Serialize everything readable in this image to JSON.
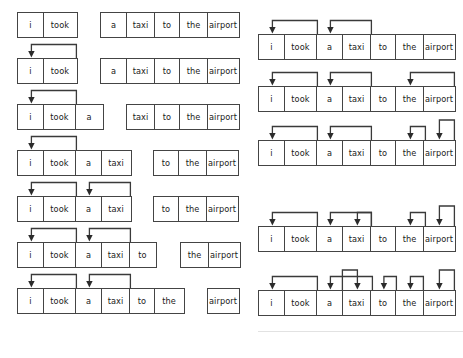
{
  "diagram": {
    "tokens": [
      "i",
      "took",
      "a",
      "taxi",
      "to",
      "the",
      "airport"
    ],
    "canvas": {
      "width": 463,
      "height": 358
    },
    "style": {
      "box_border_color": "#444444",
      "box_fill_color": "#ffffff",
      "arrow_color": "#3a3a3a",
      "text_color": "#1a1a1a"
    },
    "columns": [
      {
        "name": "left-column",
        "label": "progressive-prefix-column",
        "rows": [
          {
            "index": 0,
            "prefix": [
              "i",
              "took"
            ],
            "suffix": [
              "a",
              "taxi",
              "to",
              "the",
              "airport"
            ],
            "arrow_count": 0,
            "arrow_targets": []
          },
          {
            "index": 1,
            "prefix": [
              "i",
              "took"
            ],
            "suffix": [
              "a",
              "taxi",
              "to",
              "the",
              "airport"
            ],
            "arrow_count": 1,
            "arrow_targets": [
              "i"
            ]
          },
          {
            "index": 2,
            "prefix": [
              "i",
              "took",
              "a"
            ],
            "suffix": [
              "taxi",
              "to",
              "the",
              "airport"
            ],
            "arrow_count": 1,
            "arrow_targets": [
              "i"
            ]
          },
          {
            "index": 3,
            "prefix": [
              "i",
              "took",
              "a",
              "taxi"
            ],
            "suffix": [
              "to",
              "the",
              "airport"
            ],
            "arrow_count": 1,
            "arrow_targets": [
              "i"
            ]
          },
          {
            "index": 4,
            "prefix": [
              "i",
              "took",
              "a",
              "taxi"
            ],
            "suffix": [
              "to",
              "the",
              "airport"
            ],
            "arrow_count": 2,
            "arrow_targets": [
              "i",
              "a"
            ]
          },
          {
            "index": 5,
            "prefix": [
              "i",
              "took",
              "a",
              "taxi",
              "to"
            ],
            "suffix": [
              "the",
              "airport"
            ],
            "arrow_count": 2,
            "arrow_targets": [
              "i",
              "a"
            ]
          },
          {
            "index": 6,
            "prefix": [
              "i",
              "took",
              "a",
              "taxi",
              "to",
              "the"
            ],
            "suffix": [
              "airport"
            ],
            "arrow_count": 2,
            "arrow_targets": [
              "i",
              "a"
            ]
          }
        ]
      },
      {
        "name": "right-column",
        "label": "full-sentence-column",
        "rows": [
          {
            "index": 0,
            "tokens": [
              "i",
              "took",
              "a",
              "taxi",
              "to",
              "the",
              "airport"
            ],
            "arrow_count": 2,
            "arrow_targets": [
              "i",
              "a"
            ]
          },
          {
            "index": 1,
            "tokens": [
              "i",
              "took",
              "a",
              "taxi",
              "to",
              "the",
              "airport"
            ],
            "arrow_count": 3,
            "arrow_targets": [
              "i",
              "a",
              "the"
            ]
          },
          {
            "index": 2,
            "tokens": [
              "i",
              "took",
              "a",
              "taxi",
              "to",
              "the",
              "airport"
            ],
            "arrow_count": 4,
            "arrow_targets": [
              "i",
              "a",
              "the",
              "airport"
            ]
          },
          {
            "index": 3,
            "tokens": [
              "i",
              "took",
              "a",
              "taxi",
              "to",
              "the",
              "airport"
            ],
            "arrow_count": 4,
            "arrow_targets": [
              "i",
              "a",
              "taxi",
              "the",
              "airport"
            ]
          },
          {
            "index": 4,
            "tokens": [
              "i",
              "took",
              "a",
              "taxi",
              "to",
              "the",
              "airport"
            ],
            "arrow_count": 6,
            "arrow_targets": [
              "i",
              "a",
              "taxi",
              "to",
              "the",
              "airport"
            ]
          }
        ]
      }
    ]
  }
}
